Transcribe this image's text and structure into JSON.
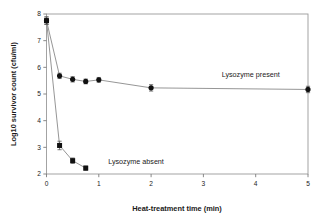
{
  "chart_data": {
    "type": "line",
    "title": "",
    "subtitle": "",
    "xlabel": "Heat-treatment time (min)",
    "ylabel": "Log10 survivor count (cfu/ml)",
    "xlim": [
      0,
      5
    ],
    "ylim": [
      2,
      8
    ],
    "xticks": [
      0,
      1,
      2,
      3,
      4,
      5
    ],
    "yticks": [
      2,
      3,
      4,
      5,
      6,
      7,
      8
    ],
    "xtick_labels": [
      "0",
      "1",
      "2",
      "3",
      "4",
      "5"
    ],
    "ytick_labels": [
      "2",
      "3",
      "4",
      "5",
      "6",
      "7",
      "8"
    ],
    "grid": false,
    "legend_position": "inline-annotations",
    "frame": "box",
    "series": [
      {
        "name": "Lysozyme present",
        "marker": "circle",
        "color": "#111111",
        "line_color": "#8a8a8a",
        "label_x": 3.35,
        "label_y": 5.72,
        "x": [
          0,
          0.25,
          0.5,
          0.75,
          1.0,
          2.0,
          5.0
        ],
        "values": [
          7.75,
          5.68,
          5.55,
          5.47,
          5.53,
          5.23,
          5.17
        ],
        "yerr": [
          0.14,
          0.1,
          0.1,
          0.09,
          0.09,
          0.12,
          0.12
        ]
      },
      {
        "name": "Lysozyme absent",
        "marker": "square",
        "color": "#111111",
        "line_color": "#8a8a8a",
        "label_x": 1.18,
        "label_y": 2.47,
        "x": [
          0,
          0.25,
          0.5,
          0.75
        ],
        "values": [
          7.75,
          3.07,
          2.5,
          2.22
        ],
        "yerr": [
          0.14,
          0.16,
          0.1,
          0.08
        ]
      }
    ]
  }
}
